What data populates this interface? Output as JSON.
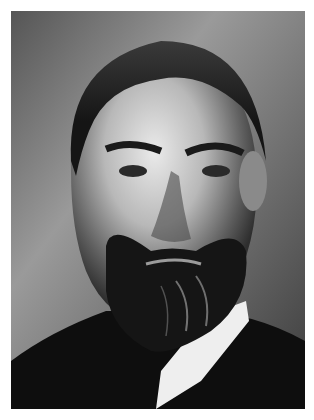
{
  "image": {
    "type": "black-and-white portrait photograph",
    "subject": "bearded man with swept-back hair in dark suit and white collar",
    "colors": {
      "background_light": "#9a9a9a",
      "background_dark": "#2a2a2a",
      "hair": "#1a1a1a",
      "skin_highlight": "#e6e6e6",
      "skin_shadow": "#5a5a5a",
      "beard": "#151515",
      "collar": "#f0f0f0",
      "suit": "#0e0e0e",
      "border": "#ffffff"
    }
  }
}
